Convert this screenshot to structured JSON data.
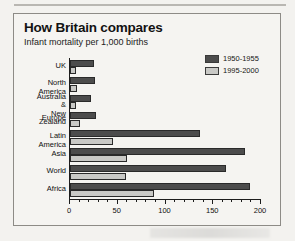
{
  "header": {
    "title": "How Britain compares",
    "subtitle": "Infant mortality per 1,000 births"
  },
  "legend": {
    "position": "top-right",
    "items": [
      {
        "label": "1950-1955",
        "color": "#4c4c4c"
      },
      {
        "label": "1995-2000",
        "color": "#c9c9c6"
      }
    ]
  },
  "axis": {
    "ticks": [
      "0",
      "50",
      "100",
      "150",
      "200"
    ]
  },
  "chart_data": {
    "type": "bar",
    "orientation": "horizontal",
    "title": "How Britain compares",
    "subtitle": "Infant mortality per 1,000 births",
    "xlabel": "Infant mortality per 1,000 births",
    "ylabel": "",
    "xlim": [
      0,
      200
    ],
    "xticks": [
      0,
      50,
      100,
      150,
      200
    ],
    "grid": false,
    "legend_position": "top-right",
    "categories": [
      "UK",
      "North America",
      "Australia &\nNew Zealand",
      "Europe",
      "Latin America",
      "Asia",
      "World",
      "Africa"
    ],
    "series": [
      {
        "name": "1950-1955",
        "color": "#4c4c4c",
        "values": [
          25,
          26,
          22,
          27,
          136,
          183,
          163,
          188
        ]
      },
      {
        "name": "1995-2000",
        "color": "#c9c9c6",
        "values": [
          6,
          7,
          6,
          10,
          45,
          60,
          59,
          88
        ]
      }
    ]
  }
}
